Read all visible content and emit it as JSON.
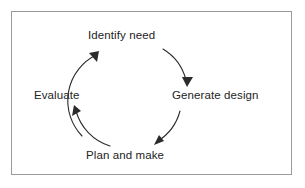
{
  "figure": {
    "name": "design-process-cycle",
    "background_color": "#ffffff",
    "border_color": "#9a9a9a",
    "stroke_color": "#2b2b2b",
    "text_color": "#242424",
    "direction": "clockwise"
  },
  "diagram_data": {
    "type": "cycle",
    "node_count": 4,
    "nodes": [
      {
        "id": "identify-need",
        "label": "Identify need",
        "position": "top"
      },
      {
        "id": "generate-design",
        "label": "Generate design",
        "position": "right"
      },
      {
        "id": "plan-and-make",
        "label": "Plan and make",
        "position": "bottom"
      },
      {
        "id": "evaluate",
        "label": "Evaluate",
        "position": "left"
      }
    ],
    "edges": [
      {
        "id": "edge-identify-to-generate",
        "from": "identify-need",
        "to": "generate-design",
        "style": "curved-arrow"
      },
      {
        "id": "edge-generate-to-plan",
        "from": "generate-design",
        "to": "plan-and-make",
        "style": "curved-arrow"
      },
      {
        "id": "edge-plan-to-evaluate",
        "from": "plan-and-make",
        "to": "evaluate",
        "style": "curved-arrow"
      },
      {
        "id": "edge-evaluate-to-identify",
        "from": "evaluate",
        "to": "identify-need",
        "style": "curved-arrow"
      }
    ]
  }
}
